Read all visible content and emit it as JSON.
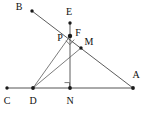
{
  "figure": {
    "background_color": "#ffffff",
    "line_color": "#4a4a4a",
    "point_color": "#1a1a1a",
    "label_color": "#101010",
    "width": 146,
    "height": 113
  },
  "points": [
    {
      "id": "B",
      "label": "B",
      "x": 32,
      "y": 11,
      "label_x": 19,
      "label_y": 7
    },
    {
      "id": "E",
      "label": "E",
      "x": 70,
      "y": 23,
      "label_x": 69,
      "label_y": 12
    },
    {
      "id": "P",
      "label": "P",
      "x": 70,
      "y": 36,
      "label_x": 60,
      "label_y": 38
    },
    {
      "id": "F",
      "label": "F",
      "x": 70,
      "y": 36,
      "label_x": 78,
      "label_y": 33
    },
    {
      "id": "M",
      "label": "M",
      "x": 81,
      "y": 48,
      "label_x": 89,
      "label_y": 42
    },
    {
      "id": "C",
      "label": "C",
      "x": 7,
      "y": 88,
      "label_x": 7,
      "label_y": 101
    },
    {
      "id": "D",
      "label": "D",
      "x": 33,
      "y": 88,
      "label_x": 33,
      "label_y": 101
    },
    {
      "id": "N",
      "label": "N",
      "x": 70,
      "y": 88,
      "label_x": 70,
      "label_y": 101
    },
    {
      "id": "A",
      "label": "A",
      "x": 133,
      "y": 88,
      "label_x": 136,
      "label_y": 75
    }
  ],
  "segments": [
    {
      "id": "B-A",
      "from": "B",
      "to": "A",
      "x1": 32,
      "y1": 11,
      "x2": 133,
      "y2": 88,
      "style": "seg"
    },
    {
      "id": "E-N",
      "from": "E",
      "to": "N",
      "x1": 70,
      "y1": 23,
      "x2": 70,
      "y2": 88,
      "style": "seg"
    },
    {
      "id": "C-A",
      "from": "C",
      "to": "A",
      "x1": 7,
      "y1": 88,
      "x2": 133,
      "y2": 88,
      "style": "seg-base"
    },
    {
      "id": "D-P",
      "from": "D",
      "to": "P",
      "x1": 33,
      "y1": 88,
      "x2": 70,
      "y2": 36,
      "style": "seg-thin"
    },
    {
      "id": "D-M",
      "from": "D",
      "to": "M",
      "x1": 33,
      "y1": 88,
      "x2": 81,
      "y2": 48,
      "style": "seg-thin"
    },
    {
      "id": "D-N",
      "from": "D",
      "to": "N",
      "x1": 33,
      "y1": 88,
      "x2": 70,
      "y2": 88,
      "style": "seg-base"
    }
  ],
  "right_angles": [
    {
      "id": "angle-at-N",
      "at": "N",
      "marker_path": "M 64.5 82.5 L 70 82.5 L 70 88"
    },
    {
      "id": "angle-at-P",
      "at": "P",
      "marker_path": "M 65.5 40.5 L 70 44.5 L 74 40"
    }
  ],
  "labels_list": [
    "B",
    "E",
    "P",
    "F",
    "M",
    "C",
    "D",
    "N",
    "A"
  ]
}
